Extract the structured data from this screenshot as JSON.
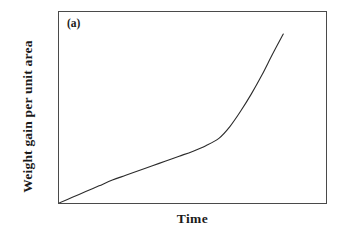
{
  "figure": {
    "panel_label": "(a)",
    "background_color": "#ffffff",
    "frame_color": "#4a4a4a",
    "curve_color": "#2b2b2b"
  },
  "chart_data": {
    "type": "line",
    "title": "",
    "subtitle": "",
    "panel_label": "(a)",
    "xlabel": "Time",
    "ylabel": "Weight gain per unit area",
    "xlim": [
      0,
      1
    ],
    "ylim": [
      0,
      1
    ],
    "grid": false,
    "legend": null,
    "xticks": [],
    "yticks": [],
    "xticklabels": [],
    "yticklabels": [],
    "annotations": [],
    "series": [
      {
        "name": "Weight gain",
        "color": "#2b2b2b",
        "line_width": 1,
        "x": [
          0.0,
          0.05,
          0.1,
          0.15,
          0.2,
          0.25,
          0.3,
          0.35,
          0.4,
          0.45,
          0.5,
          0.55,
          0.6,
          0.64,
          0.68,
          0.72,
          0.76,
          0.8,
          0.84
        ],
        "y": [
          0.0,
          0.03,
          0.06,
          0.09,
          0.12,
          0.145,
          0.17,
          0.195,
          0.22,
          0.245,
          0.27,
          0.3,
          0.34,
          0.4,
          0.48,
          0.57,
          0.67,
          0.78,
          0.885
        ]
      }
    ]
  }
}
